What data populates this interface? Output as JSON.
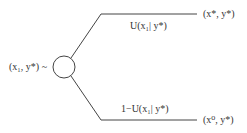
{
  "diagram": {
    "type": "decision-tree",
    "root": {
      "label": "(x₁, y*) ~",
      "node_shape": "circle"
    },
    "branches": [
      {
        "probability_label": "U(x₁| y*)",
        "outcome_label": "(x*, y*)"
      },
      {
        "probability_label": "1−U(x₁| y*)",
        "outcome_label": "(x⁰, y*)"
      }
    ],
    "colors": {
      "line": "#444444",
      "text": "#333333",
      "background": "#ffffff"
    }
  }
}
